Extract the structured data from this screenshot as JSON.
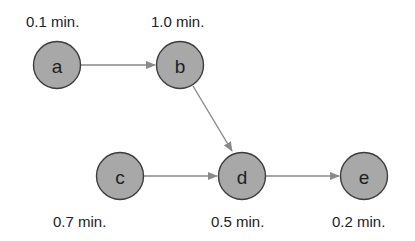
{
  "diagram": {
    "type": "precedence-network",
    "colors": {
      "node_fill": "#a8a8a8",
      "node_stroke": "#3c3c3c",
      "edge": "#8a8a8a",
      "text": "#222222"
    },
    "nodes": [
      {
        "id": "a",
        "label": "a",
        "time": "0.1 min.",
        "cx": 57,
        "cy": 65,
        "time_x": 26,
        "time_y": 27,
        "time_pos": "above"
      },
      {
        "id": "b",
        "label": "b",
        "time": "1.0 min.",
        "cx": 180,
        "cy": 65,
        "time_x": 151,
        "time_y": 27,
        "time_pos": "above"
      },
      {
        "id": "c",
        "label": "c",
        "time": "0.7 min.",
        "cx": 120,
        "cy": 176,
        "time_x": 53,
        "time_y": 227,
        "time_pos": "below"
      },
      {
        "id": "d",
        "label": "d",
        "time": "0.5 min.",
        "cx": 242,
        "cy": 176,
        "time_x": 211,
        "time_y": 227,
        "time_pos": "below"
      },
      {
        "id": "e",
        "label": "e",
        "time": "0.2 min.",
        "cx": 364,
        "cy": 176,
        "time_x": 332,
        "time_y": 227,
        "time_pos": "below"
      }
    ],
    "edges": [
      {
        "from": "a",
        "to": "b"
      },
      {
        "from": "b",
        "to": "d"
      },
      {
        "from": "c",
        "to": "d"
      },
      {
        "from": "d",
        "to": "e"
      }
    ]
  }
}
